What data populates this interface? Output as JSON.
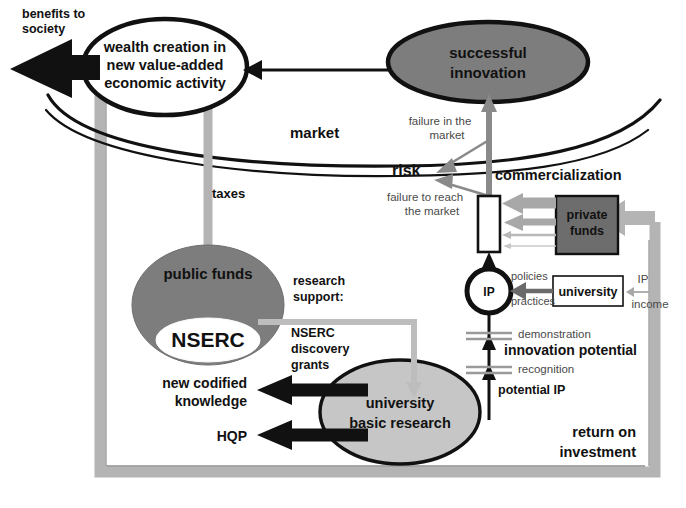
{
  "diagram": {
    "title_nodes": {
      "wealth": "wealth creation in\nnew value-added\neconomic activity",
      "wealth_line1": "wealth creation in",
      "wealth_line2": "new value-added",
      "wealth_line3": "economic activity",
      "successful_innovation_line1": "successful",
      "successful_innovation_line2": "innovation",
      "public_funds": "public funds",
      "nserc": "NSERC",
      "university_basic_research_line1": "university",
      "university_basic_research_line2": "basic research",
      "private_funds_line1": "private",
      "private_funds_line2": "funds",
      "university_box": "university",
      "ip_circle": "IP"
    },
    "edge_labels": {
      "benefits_line1": "benefits to",
      "benefits_line2": "society",
      "market": "market",
      "taxes": "taxes",
      "risk": "risk",
      "failure_in_market_line1": "failure in the",
      "failure_in_market_line2": "market",
      "failure_to_reach_line1": "failure to reach",
      "failure_to_reach_line2": "the market",
      "commercialization": "commercialization",
      "research_support_line1": "research",
      "research_support_line2": "support:",
      "nserc_grants_line1": "NSERC",
      "nserc_grants_line2": "discovery",
      "nserc_grants_line3": "grants",
      "new_codified_line1": "new codified",
      "new_codified_line2": "knowledge",
      "hqp": "HQP",
      "policies": "policies",
      "practices": "practices",
      "ip_income_line1": "IP",
      "ip_income_line2": "income",
      "demonstration": "demonstration",
      "innovation_potential": "innovation potential",
      "recognition": "recognition",
      "potential_ip": "potential IP",
      "return_on_investment_line1": "return on",
      "return_on_investment_line2": "investment"
    },
    "colors": {
      "dark_gray_fill": "#7d7d7d",
      "light_gray_fill": "#c6c6c6",
      "mid_gray_arrow": "#9d9d9d",
      "pale_gray_arrow": "#bdbdbd",
      "black": "#111111",
      "white": "#ffffff",
      "gray_text": "#4a4a4a",
      "loop_gray": "#b4b4b4",
      "frame_gray": "#b0b0b0"
    }
  }
}
